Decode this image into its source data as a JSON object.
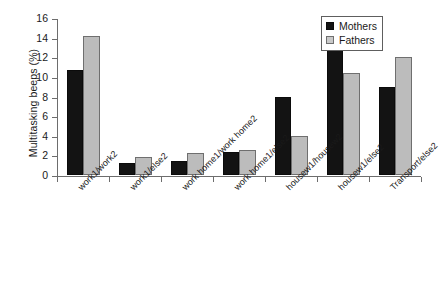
{
  "chart_data": {
    "type": "bar",
    "title": "",
    "xlabel": "",
    "ylabel": "Multitasking beeps (%)",
    "ylim": [
      0,
      16
    ],
    "yticks": [
      0,
      2,
      4,
      6,
      8,
      10,
      12,
      14,
      16
    ],
    "grid": false,
    "legend_position": "top-right",
    "categories": [
      "work1/work2",
      "work1/else2",
      "work home1/work home2",
      "work home1/else2",
      "housew1/housew2",
      "housew1/else2",
      "Transport/else2"
    ],
    "series": [
      {
        "name": "Mothers",
        "color": "#131313",
        "values": [
          10.7,
          1.2,
          1.4,
          2.3,
          8.0,
          14.2,
          9.0
        ]
      },
      {
        "name": "Fathers",
        "color": "#bcbcbc",
        "values": [
          14.2,
          1.8,
          2.2,
          2.5,
          4.0,
          10.4,
          12.0
        ]
      }
    ]
  },
  "legend": {
    "entries": [
      {
        "label": "Mothers"
      },
      {
        "label": "Fathers"
      }
    ]
  }
}
